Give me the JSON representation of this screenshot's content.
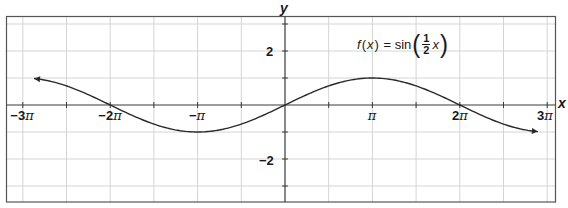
{
  "chart_data": {
    "type": "line",
    "function": "sin(x/2)",
    "xlabel": "x",
    "ylabel": "y",
    "xlim": [
      -9.42,
      9.42
    ],
    "ylim": [
      -3.5,
      3.5
    ],
    "grid": true,
    "x_ticks": [
      {
        "value": -9.4248,
        "label": "−3π"
      },
      {
        "value": -6.2832,
        "label": "−2π"
      },
      {
        "value": -3.1416,
        "label": "−π"
      },
      {
        "value": 3.1416,
        "label": "π"
      },
      {
        "value": 6.2832,
        "label": "2π"
      },
      {
        "value": 9.4248,
        "label": "3π"
      }
    ],
    "x_minor_ticks_step": "π/2",
    "y_ticks": [
      {
        "value": 2,
        "label": "2"
      },
      {
        "value": -2,
        "label": "−2"
      }
    ],
    "y_minor_ticks": [
      -3,
      -1,
      1,
      3
    ],
    "series": [
      {
        "name": "f(x) = sin(x/2)",
        "domain": [
          -9.02,
          9.09
        ],
        "arrows": "both",
        "points": [
          {
            "x": -9.02,
            "y": 0.98
          },
          {
            "x": -6.2832,
            "y": 0
          },
          {
            "x": -3.1416,
            "y": -1
          },
          {
            "x": 0,
            "y": 0
          },
          {
            "x": 3.1416,
            "y": 1
          },
          {
            "x": 6.2832,
            "y": 0
          },
          {
            "x": 9.09,
            "y": -0.99
          }
        ]
      }
    ]
  },
  "labels": {
    "x_axis": "x",
    "y_axis": "y",
    "x_ticks": {
      "neg3pi_a": "−3",
      "neg3pi_b": "π",
      "neg2pi_a": "−2",
      "neg2pi_b": "π",
      "negpi_a": "−",
      "negpi_b": "π",
      "pi_b": "π",
      "twopi_a": "2",
      "twopi_b": "π",
      "threepi_a": "3",
      "threepi_b": "π"
    },
    "y_ticks": {
      "pos2": "2",
      "neg2": "−2"
    },
    "formula": {
      "lhs_f": "f",
      "lhs_open": "(",
      "lhs_x": "x",
      "lhs_close": ")",
      "equals": " = sin",
      "paren_open": "(",
      "frac_num": "1",
      "frac_den": "2",
      "arg_x": "x",
      "paren_close": ")"
    }
  },
  "colors": {
    "curve": "#2a2a2a",
    "axis": "#3a3a3a",
    "grid": "#d4d4d4",
    "frame": "#555555",
    "background": "#ffffff"
  }
}
